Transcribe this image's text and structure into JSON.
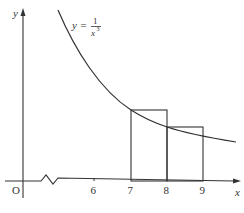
{
  "diagram": {
    "function_label": {
      "lhs": "y =",
      "numerator": "1",
      "denominator": "x",
      "exponent": "3"
    },
    "axes": {
      "x_label": "x",
      "y_label": "y",
      "origin_label": "O",
      "axis_break": true
    },
    "x_ticks": [
      {
        "value": "6"
      },
      {
        "value": "7"
      },
      {
        "value": "8"
      },
      {
        "value": "9"
      }
    ],
    "rectangles": [
      {
        "from": "7",
        "to": "8",
        "height": "f(7)"
      },
      {
        "from": "8",
        "to": "9",
        "height": "f(8)"
      }
    ],
    "colors": {
      "line": "#333333",
      "background": "#ffffff"
    }
  }
}
